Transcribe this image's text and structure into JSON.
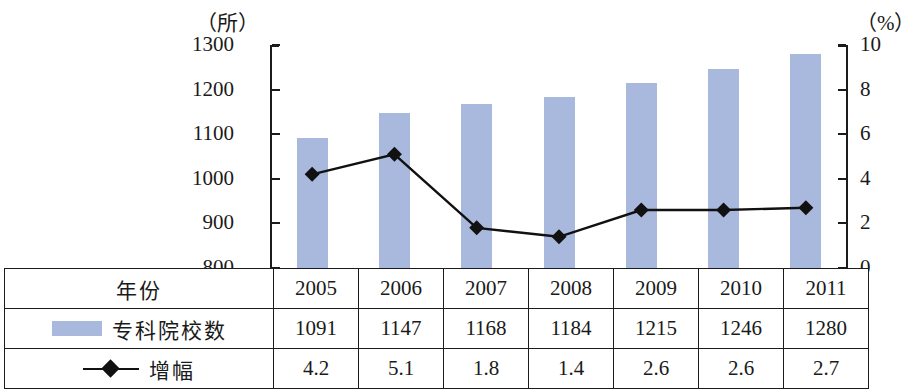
{
  "chart_data": {
    "type": "bar",
    "title": "",
    "subtitle": "",
    "xlabel": "",
    "categories": [
      "2005",
      "2006",
      "2007",
      "2008",
      "2009",
      "2010",
      "2011"
    ],
    "grid": false,
    "legend_position": "table-row-labels",
    "axes": {
      "left": {
        "unit": "（所）",
        "label": "专科院校数",
        "min": 800,
        "max": 1300,
        "step": 100,
        "ticks": [
          "1300",
          "1200",
          "1100",
          "1000",
          "900",
          "800"
        ],
        "tick_values": [
          1300,
          1200,
          1100,
          1000,
          900,
          800
        ]
      },
      "right": {
        "unit": "（%）",
        "label": "增幅",
        "min": 0,
        "max": 10,
        "step": 2,
        "ticks": [
          "10",
          "8",
          "6",
          "4",
          "2",
          "0"
        ],
        "tick_values": [
          10,
          8,
          6,
          4,
          2,
          0
        ]
      }
    },
    "series": [
      {
        "name": "专科院校数",
        "type": "bar",
        "axis": "left",
        "color": "#a9b9dd",
        "values": [
          1091,
          1147,
          1168,
          1184,
          1215,
          1246,
          1280
        ]
      },
      {
        "name": "增幅",
        "type": "line",
        "axis": "right",
        "color": "#111111",
        "marker": "diamond",
        "values": [
          4.2,
          5.1,
          1.8,
          1.4,
          2.6,
          2.6,
          2.7
        ]
      }
    ]
  },
  "table": {
    "rows": [
      {
        "label": "年份",
        "legend": "none",
        "values": [
          "2005",
          "2006",
          "2007",
          "2008",
          "2009",
          "2010",
          "2011"
        ]
      },
      {
        "label": "专科院校数",
        "legend": "bar-swatch",
        "values": [
          "1091",
          "1147",
          "1168",
          "1184",
          "1215",
          "1246",
          "1280"
        ]
      },
      {
        "label": "增幅",
        "legend": "line-diamond",
        "values": [
          "4.2",
          "5.1",
          "1.8",
          "1.4",
          "2.6",
          "2.6",
          "2.7"
        ]
      }
    ]
  },
  "colors": {
    "bar": "#a9b9dd",
    "line": "#111111",
    "axis": "#1b1b1b",
    "background": "#ffffff"
  }
}
